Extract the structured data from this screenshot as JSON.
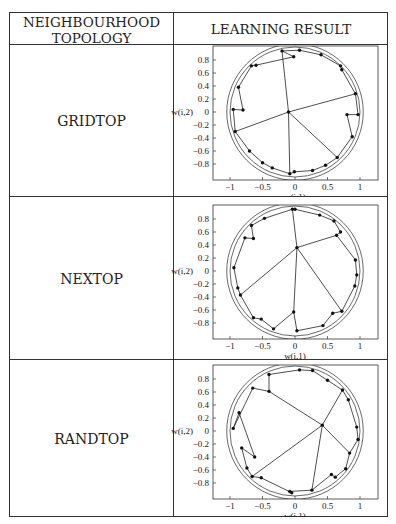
{
  "table": {
    "headers": [
      "NEIGHBOURHOOD",
      "TOPOLOGY",
      "LEARNING RESULT"
    ],
    "rows": [
      {
        "topology": "GRIDTOP"
      },
      {
        "topology": "NEXTOP"
      },
      {
        "topology": "RANDTOP"
      }
    ]
  },
  "plots": {
    "xlabel": "w(i,1)",
    "ylabel": "w(i,2)",
    "xticks": [
      "-1",
      "-0.5",
      "0",
      "0.5",
      "1"
    ],
    "yticks": [
      "0.8",
      "0.6",
      "0.4",
      "0.2",
      "0",
      "-0.2",
      "-0.4",
      "-0.6",
      "-0.8"
    ]
  },
  "chart_data": [
    {
      "type": "scatter",
      "title": "GRIDTOP",
      "xlabel": "w(i,1)",
      "ylabel": "w(i,2)",
      "xlim": [
        -1.2,
        1.3
      ],
      "ylim": [
        -1.0,
        1.0
      ],
      "points": [
        [
          -0.1,
          0.0
        ],
        [
          -0.2,
          0.94
        ],
        [
          0.07,
          0.95
        ],
        [
          0.4,
          0.88
        ],
        [
          0.7,
          0.71
        ],
        [
          0.72,
          0.65
        ],
        [
          0.93,
          0.28
        ],
        [
          0.97,
          -0.04
        ],
        [
          0.8,
          -0.04
        ],
        [
          0.88,
          -0.38
        ],
        [
          0.65,
          -0.7
        ],
        [
          0.47,
          -0.82
        ],
        [
          0.27,
          -0.9
        ],
        [
          -0.01,
          -0.92
        ],
        [
          -0.08,
          -0.95
        ],
        [
          -0.35,
          -0.86
        ],
        [
          -0.5,
          -0.78
        ],
        [
          -0.7,
          -0.6
        ],
        [
          -0.92,
          -0.3
        ],
        [
          -0.95,
          0.04
        ],
        [
          -0.8,
          0.03
        ],
        [
          -0.87,
          0.38
        ],
        [
          -0.67,
          0.71
        ],
        [
          -0.6,
          0.72
        ],
        [
          -0.02,
          0.85
        ]
      ]
    },
    {
      "type": "scatter",
      "title": "NEXTOP",
      "xlabel": "w(i,1)",
      "ylabel": "w(i,2)",
      "xlim": [
        -1.2,
        1.3
      ],
      "ylim": [
        -1.0,
        1.0
      ],
      "points": [
        [
          0.03,
          0.36
        ],
        [
          -0.04,
          0.95
        ],
        [
          0.0,
          0.95
        ],
        [
          0.38,
          0.86
        ],
        [
          0.6,
          0.77
        ],
        [
          0.7,
          0.6
        ],
        [
          0.64,
          0.55
        ],
        [
          0.93,
          0.17
        ],
        [
          0.95,
          -0.06
        ],
        [
          0.92,
          -0.23
        ],
        [
          0.72,
          -0.62
        ],
        [
          0.58,
          -0.65
        ],
        [
          0.43,
          -0.84
        ],
        [
          0.03,
          -0.92
        ],
        [
          -0.02,
          -0.63
        ],
        [
          -0.33,
          -0.89
        ],
        [
          -0.52,
          -0.74
        ],
        [
          -0.64,
          -0.72
        ],
        [
          -0.84,
          -0.37
        ],
        [
          -0.88,
          -0.26
        ],
        [
          -0.94,
          0.05
        ],
        [
          -0.77,
          0.51
        ],
        [
          -0.64,
          0.5
        ],
        [
          -0.67,
          0.7
        ],
        [
          -0.47,
          0.81
        ]
      ]
    },
    {
      "type": "scatter",
      "title": "RANDTOP",
      "xlabel": "w(i,1)",
      "ylabel": "w(i,2)",
      "xlim": [
        -1.2,
        1.3
      ],
      "ylim": [
        -1.0,
        1.0
      ],
      "points": [
        [
          0.42,
          0.09
        ],
        [
          -0.4,
          0.61
        ],
        [
          -0.4,
          0.87
        ],
        [
          0.07,
          0.94
        ],
        [
          0.27,
          0.93
        ],
        [
          0.5,
          0.78
        ],
        [
          0.73,
          0.63
        ],
        [
          0.82,
          0.48
        ],
        [
          0.95,
          0.06
        ],
        [
          0.97,
          -0.13
        ],
        [
          0.84,
          -0.34
        ],
        [
          0.78,
          -0.58
        ],
        [
          0.62,
          -0.71
        ],
        [
          0.56,
          -0.67
        ],
        [
          0.26,
          -0.91
        ],
        [
          -0.08,
          -0.93
        ],
        [
          -0.05,
          -0.95
        ],
        [
          -0.52,
          -0.72
        ],
        [
          -0.66,
          -0.7
        ],
        [
          -0.74,
          -0.57
        ],
        [
          -0.82,
          -0.26
        ],
        [
          -0.62,
          -0.4
        ],
        [
          -0.86,
          0.28
        ],
        [
          -0.95,
          0.04
        ],
        [
          -0.65,
          0.66
        ]
      ]
    }
  ]
}
